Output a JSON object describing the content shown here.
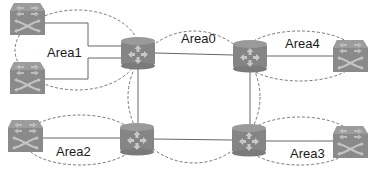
{
  "diagram": {
    "type": "ospf-multi-area-topology",
    "colors": {
      "device_fill": "#8a8a8a",
      "device_dark": "#6e6e6e",
      "device_light": "#a8a8a8",
      "link": "#555555",
      "area_boundary": "#444444",
      "text": "#1a1a1a"
    },
    "areas": [
      {
        "id": "area0",
        "label": "Area0"
      },
      {
        "id": "area1",
        "label": "Area1"
      },
      {
        "id": "area2",
        "label": "Area2"
      },
      {
        "id": "area3",
        "label": "Area3"
      },
      {
        "id": "area4",
        "label": "Area4"
      }
    ],
    "nodes": [
      {
        "id": "sw1",
        "icon": "switch-icon",
        "area": "Area1"
      },
      {
        "id": "sw2",
        "icon": "switch-icon",
        "area": "Area1"
      },
      {
        "id": "r1",
        "icon": "router-icon",
        "area": "Area0/Area1"
      },
      {
        "id": "r2",
        "icon": "router-icon",
        "area": "Area0/Area4"
      },
      {
        "id": "r3",
        "icon": "router-icon",
        "area": "Area0/Area2"
      },
      {
        "id": "r4",
        "icon": "router-icon",
        "area": "Area0/Area3"
      },
      {
        "id": "sw4",
        "icon": "switch-icon",
        "area": "Area4"
      },
      {
        "id": "sw3",
        "icon": "switch-icon",
        "area": "Area2"
      },
      {
        "id": "sw5",
        "icon": "switch-icon",
        "area": "Area3"
      }
    ],
    "links": [
      [
        "sw1",
        "r1"
      ],
      [
        "sw2",
        "r1"
      ],
      [
        "r1",
        "r2"
      ],
      [
        "r1",
        "r3"
      ],
      [
        "r2",
        "r4"
      ],
      [
        "r3",
        "r4"
      ],
      [
        "r2",
        "sw4"
      ],
      [
        "sw3",
        "r3"
      ],
      [
        "r4",
        "sw5"
      ]
    ]
  }
}
